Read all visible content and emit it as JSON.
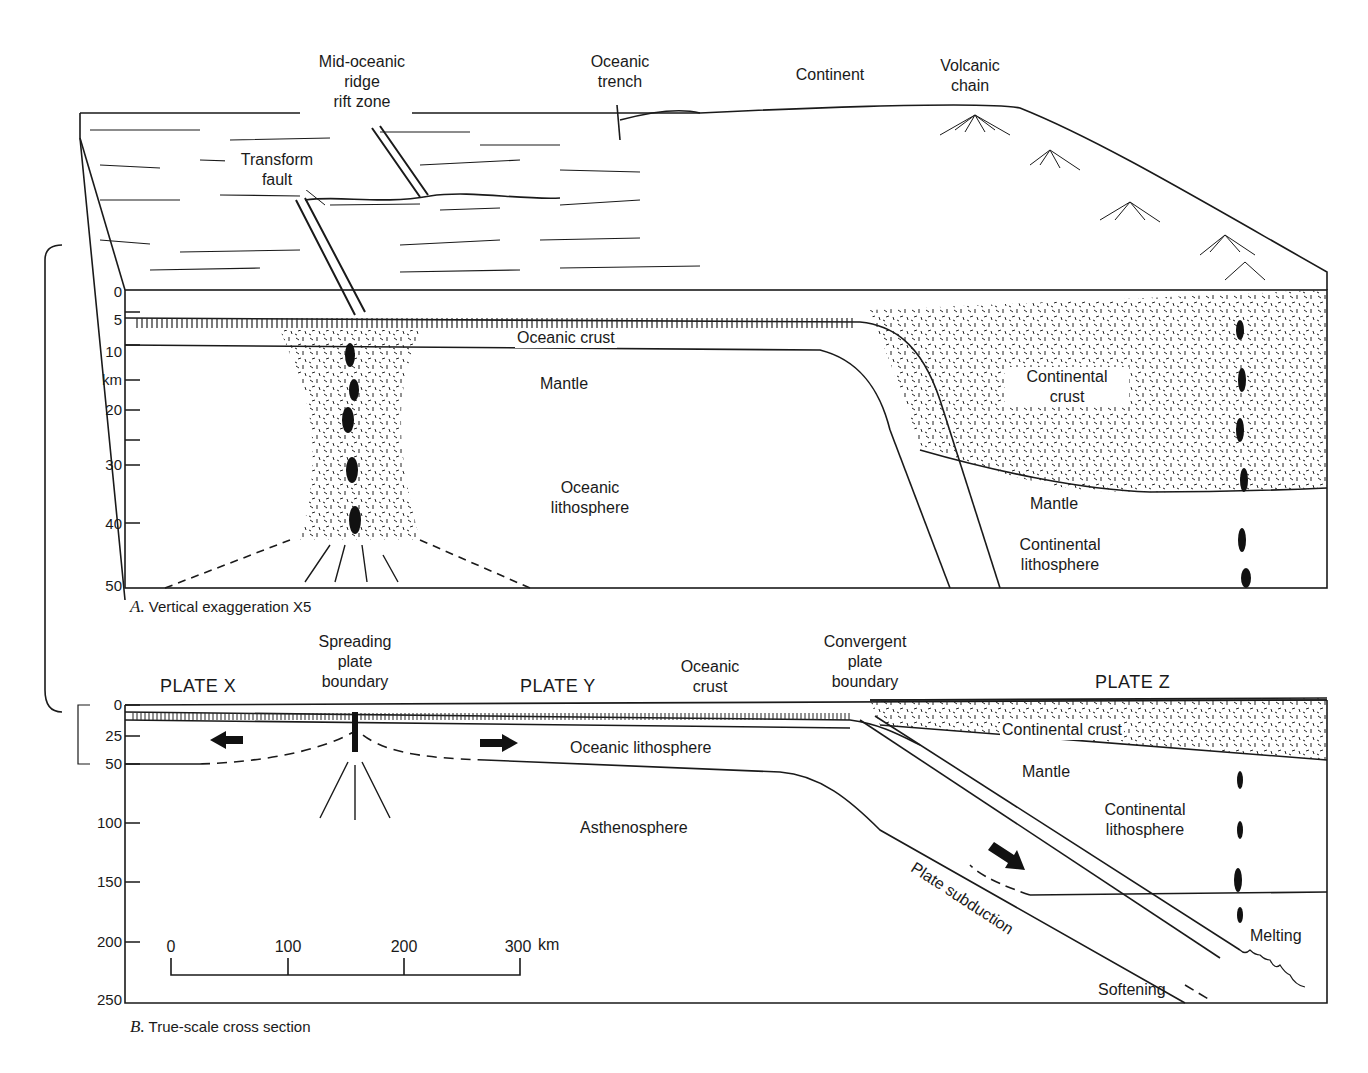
{
  "figure": {
    "panel_a": {
      "caption_letter": "A.",
      "caption_text": "Vertical exaggeration X5",
      "labels": {
        "ridge_l1": "Mid-oceanic",
        "ridge_l2": "ridge",
        "ridge_l3": "rift zone",
        "trench_l1": "Oceanic",
        "trench_l2": "trench",
        "continent": "Continent",
        "volcanic_l1": "Volcanic",
        "volcanic_l2": "chain",
        "transform_l1": "Transform",
        "transform_l2": "fault",
        "oceanic_crust": "Oceanic crust",
        "mantle": "Mantle",
        "oceanic_lith_l1": "Oceanic",
        "oceanic_lith_l2": "lithosphere",
        "cont_crust_l1": "Continental",
        "cont_crust_l2": "crust",
        "mantle_right": "Mantle",
        "cont_lith_l1": "Continental",
        "cont_lith_l2": "lithosphere"
      },
      "depth_axis": {
        "unit": "km",
        "ticks": [
          "0",
          "5",
          "10",
          "20",
          "30",
          "40",
          "50"
        ]
      }
    },
    "panel_b": {
      "caption_letter": "B.",
      "caption_text": "True-scale cross section",
      "labels": {
        "plate_x": "PLATE X",
        "plate_y": "PLATE Y",
        "plate_z": "PLATE  Z",
        "spreading_l1": "Spreading",
        "spreading_l2": "plate",
        "spreading_l3": "boundary",
        "oc_crust_l1": "Oceanic",
        "oc_crust_l2": "crust",
        "convergent_l1": "Convergent",
        "convergent_l2": "plate",
        "convergent_l3": "boundary",
        "oceanic_lithosphere": "Oceanic lithosphere",
        "continental_crust": "Continental crust",
        "mantle": "Mantle",
        "cont_lith_l1": "Continental",
        "cont_lith_l2": "lithosphere",
        "asthenosphere": "Asthenosphere",
        "plate_subduction": "Plate subduction",
        "melting": "Melting",
        "softening": "Softening"
      },
      "depth_axis": {
        "ticks": [
          "0",
          "25",
          "50",
          "100",
          "150",
          "200",
          "250"
        ]
      },
      "scale_bar": {
        "ticks": [
          "0",
          "100",
          "200",
          "300"
        ],
        "unit": "km"
      }
    }
  }
}
